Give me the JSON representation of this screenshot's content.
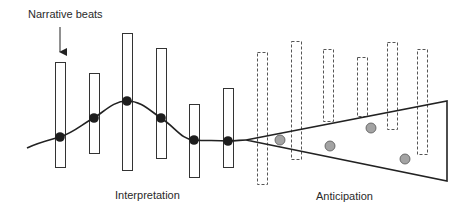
{
  "labels": {
    "narrative_beats": "Narrative beats",
    "interpretation": "Interpretation",
    "anticipation": "Anticipation"
  },
  "colors": {
    "stroke": "#222222",
    "beat_dot": "#1e1e1e",
    "predicted_dot_fill": "#a3a3a3",
    "predicted_dot_stroke": "#555555",
    "background": "#ffffff"
  },
  "interpretation_beats": [
    {
      "x": 55,
      "y_top": 62,
      "y_bottom": 167,
      "dot": [
        60,
        137
      ]
    },
    {
      "x": 89,
      "y_top": 73,
      "y_bottom": 153,
      "dot": [
        94,
        118
      ]
    },
    {
      "x": 122,
      "y_top": 33,
      "y_bottom": 170,
      "dot": [
        127,
        101
      ]
    },
    {
      "x": 156,
      "y_top": 48,
      "y_bottom": 158,
      "dot": [
        161,
        118
      ]
    },
    {
      "x": 189,
      "y_top": 104,
      "y_bottom": 177,
      "dot": [
        194,
        140
      ]
    },
    {
      "x": 223,
      "y_top": 88,
      "y_bottom": 167,
      "dot": [
        228,
        141
      ]
    }
  ],
  "anticipation_beats": [
    {
      "x": 257,
      "y_top": 52,
      "y_bottom": 184
    },
    {
      "x": 291,
      "y_top": 41,
      "y_bottom": 159
    },
    {
      "x": 323,
      "y_top": 49,
      "y_bottom": 121
    },
    {
      "x": 357,
      "y_top": 57,
      "y_bottom": 116
    },
    {
      "x": 387,
      "y_top": 42,
      "y_bottom": 129
    },
    {
      "x": 417,
      "y_top": 49,
      "y_bottom": 154
    }
  ],
  "predicted_points": [
    [
      280,
      140
    ],
    [
      330,
      146
    ],
    [
      371,
      128
    ],
    [
      405,
      159
    ]
  ],
  "cone": {
    "apex": [
      246,
      140
    ],
    "top_right": [
      447,
      101
    ],
    "bottom_right": [
      447,
      181
    ]
  }
}
